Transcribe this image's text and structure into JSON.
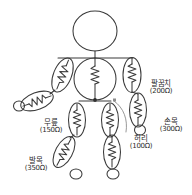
{
  "figure": {
    "title": "",
    "background_color": "#ffffff",
    "stroke_color": "#3a3a3a",
    "text_color": "#2a2a2a"
  },
  "body_parts": {
    "head": "head-circle",
    "neck": "neck-line",
    "shoulders": "shoulder-bar",
    "torso": "torso-circle",
    "hip_junction": "hip-node",
    "left_arm": "left-arm-segments",
    "right_arm": "right-arm-segments",
    "left_leg": "left-leg-segments",
    "right_leg": "right-leg-segments",
    "left_hand": "left-hand-circle",
    "right_hand": "right-hand-circle",
    "left_foot": "left-foot-circle",
    "right_foot": "right-foot-circle"
  },
  "labels": [
    {
      "id": "elbow",
      "name": "팔꿈치",
      "value": "(200Ω)"
    },
    {
      "id": "wrist",
      "name": "손목",
      "value": "(300Ω)"
    },
    {
      "id": "waist",
      "name": "허리",
      "value": "(100Ω)"
    },
    {
      "id": "knee",
      "name": "무릎",
      "value": "(150Ω)"
    },
    {
      "id": "ankle",
      "name": "발목",
      "value": "(350Ω)"
    }
  ],
  "resistor_count": 9
}
